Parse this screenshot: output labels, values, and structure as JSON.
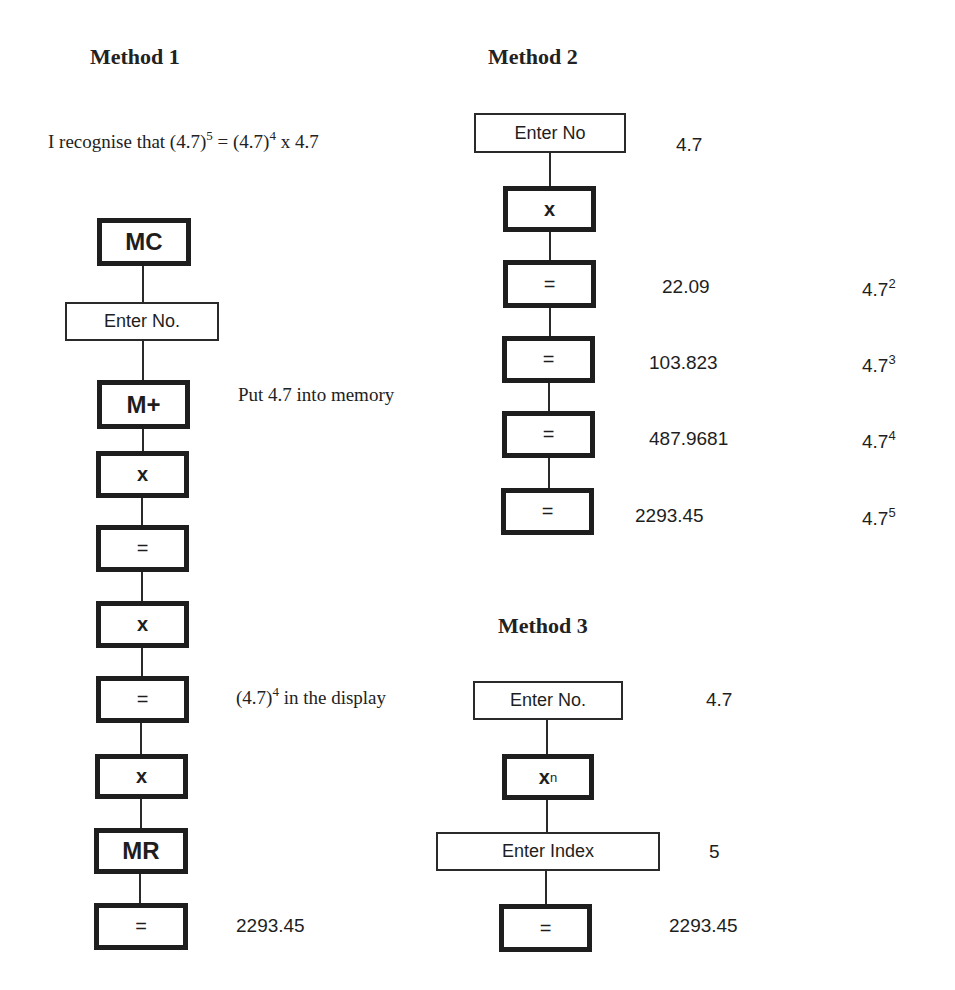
{
  "method1": {
    "title": "Method 1",
    "intro": {
      "prefix": "I recognise that (4.7)",
      "exp1": "5",
      "mid": " = (4.7)",
      "exp2": "4",
      "suffix": " x 4.7"
    },
    "steps": [
      {
        "label": "MC",
        "type": "key"
      },
      {
        "label": "Enter No.",
        "type": "entry"
      },
      {
        "label": "M+",
        "type": "key"
      },
      {
        "label": "x",
        "type": "key"
      },
      {
        "label": "=",
        "type": "key"
      },
      {
        "label": "x",
        "type": "key"
      },
      {
        "label": "=",
        "type": "key"
      },
      {
        "label": "x",
        "type": "key"
      },
      {
        "label": "MR",
        "type": "key"
      },
      {
        "label": "=",
        "type": "key"
      }
    ],
    "annotations": {
      "memory": "Put 4.7 into memory",
      "display_prefix": "(4.7)",
      "display_exp": "4",
      "display_suffix": " in the display",
      "result": "2293.45"
    }
  },
  "method2": {
    "title": "Method 2",
    "steps": [
      {
        "label": "Enter No",
        "type": "entry",
        "display": "4.7",
        "power_base": "",
        "power_exp": ""
      },
      {
        "label": "x",
        "type": "key",
        "display": "",
        "power_base": "",
        "power_exp": ""
      },
      {
        "label": "=",
        "type": "key",
        "display": "22.09",
        "power_base": "4.7",
        "power_exp": "2"
      },
      {
        "label": "=",
        "type": "key",
        "display": "103.823",
        "power_base": "4.7",
        "power_exp": "3"
      },
      {
        "label": "=",
        "type": "key",
        "display": "487.9681",
        "power_base": "4.7",
        "power_exp": "4"
      },
      {
        "label": "=",
        "type": "key",
        "display": "2293.45",
        "power_base": "4.7",
        "power_exp": "5"
      }
    ]
  },
  "method3": {
    "title": "Method 3",
    "steps": [
      {
        "label": "Enter No.",
        "type": "entry",
        "display": "4.7"
      },
      {
        "label_base": "x",
        "label_exp": "n",
        "type": "key",
        "display": ""
      },
      {
        "label": "Enter Index",
        "type": "entry",
        "display": "5"
      },
      {
        "label": "=",
        "type": "key",
        "display": "2293.45"
      }
    ]
  }
}
